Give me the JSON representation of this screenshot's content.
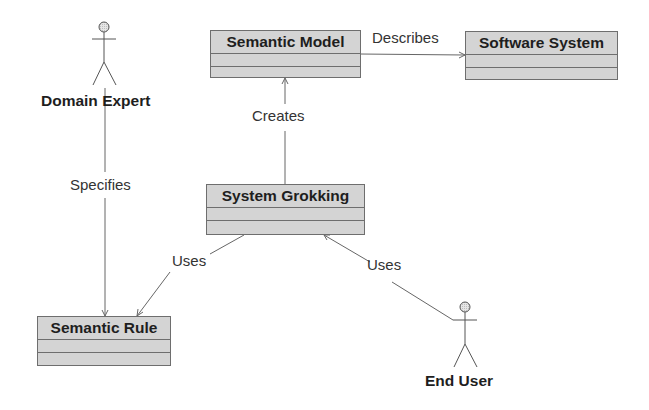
{
  "diagram": {
    "type": "UML use-case / class diagram",
    "actors": [
      {
        "id": "domain_expert",
        "name": "Domain Expert"
      },
      {
        "id": "end_user",
        "name": "End User"
      }
    ],
    "classes": [
      {
        "id": "semantic_model",
        "name": "Semantic Model"
      },
      {
        "id": "software_system",
        "name": "Software System"
      },
      {
        "id": "system_grokking",
        "name": "System Grokking"
      },
      {
        "id": "semantic_rule",
        "name": "Semantic Rule"
      }
    ],
    "relations": [
      {
        "id": "describes",
        "from": "Semantic Model",
        "to": "Software System",
        "label": "Describes"
      },
      {
        "id": "creates",
        "from": "System Grokking",
        "to": "Semantic Model",
        "label": "Creates"
      },
      {
        "id": "specifies",
        "from": "Domain Expert",
        "to": "Semantic Rule",
        "label": "Specifies"
      },
      {
        "id": "uses_rule",
        "from": "System Grokking",
        "to": "Semantic Rule",
        "label": "Uses"
      },
      {
        "id": "uses_grokking",
        "from": "End User",
        "to": "System Grokking",
        "label": "Uses"
      }
    ]
  },
  "colors": {
    "line": "#6e6e6e",
    "fill": "#e4e4e4",
    "text": "#1e1e1e"
  }
}
